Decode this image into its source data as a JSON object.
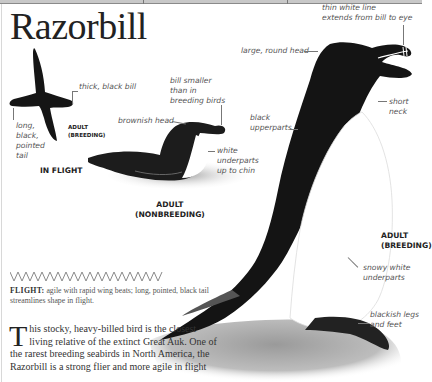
{
  "page": {
    "title": "Razorbill"
  },
  "illustrations": {
    "in_flight": {
      "caption": "IN FLIGHT",
      "sub_label": [
        "ADULT",
        "(BREEDING)"
      ],
      "annotations": {
        "bill": "thick, black bill",
        "tail": [
          "long,",
          "black,",
          "pointed",
          "tail"
        ]
      }
    },
    "nonbreeding": {
      "caption": [
        "ADULT",
        "(NONBREEDING)"
      ],
      "annotations": {
        "bill": [
          "bill smaller",
          "than in",
          "breeding birds"
        ],
        "head": "brownish head",
        "underparts": [
          "white",
          "underparts",
          "up to chin"
        ]
      }
    },
    "breeding": {
      "caption": [
        "ADULT",
        "(BREEDING)"
      ],
      "annotations": {
        "bill_line": [
          "thin white line",
          "extends from bill to eye"
        ],
        "head": "large, round head",
        "upperparts": [
          "black",
          "upperparts"
        ],
        "neck": [
          "short",
          "neck"
        ],
        "underparts": [
          "snowy white",
          "underparts"
        ],
        "legs": [
          "blackish legs",
          "and feet"
        ]
      }
    }
  },
  "flight_pattern": {
    "icon": "zigzag-flight-pattern-icon",
    "label": "FLIGHT:",
    "text": "agile with rapid wing beats; long, pointed, black tail streamlines shape in flight."
  },
  "description": {
    "dropcap": "T",
    "text": "his stocky, heavy-billed bird is the closest living relative of the extinct Great Auk. One of the rarest breeding seabirds in North America, the Razorbill is a strong flier and more agile in flight"
  },
  "colors": {
    "ink": "#222222",
    "annotation": "#555555",
    "leader_line": "#777777",
    "bird_black": "#141414",
    "rock": "#a8a8a8"
  }
}
